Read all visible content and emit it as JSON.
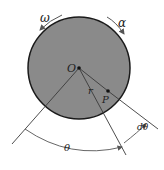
{
  "diagram": {
    "labels": {
      "omega": "ω",
      "alpha": "α",
      "center": "O",
      "radius": "r",
      "point": "P",
      "theta": "θ",
      "dtheta": "dθ"
    },
    "colors": {
      "disk_fill": "#8a8a8a",
      "disk_stroke": "#1a1a1a",
      "lines": "#3a3a3a",
      "arrows": "#555555"
    }
  }
}
